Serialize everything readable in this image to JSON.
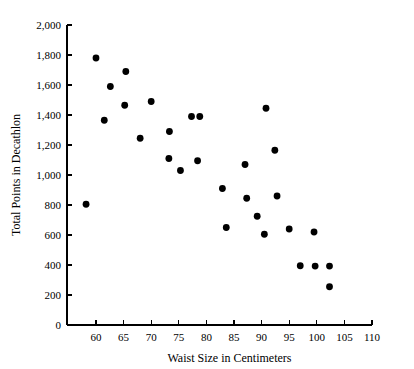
{
  "chart_data": {
    "type": "scatter",
    "title": "",
    "xlabel": "Waist Size in Centimeters",
    "ylabel": "Total Points in Decathlon",
    "xlim": [
      56,
      110
    ],
    "ylim": [
      0,
      2000
    ],
    "xticks": [
      60,
      65,
      70,
      75,
      80,
      85,
      90,
      95,
      100,
      105,
      110
    ],
    "xtick_labels": [
      "60",
      "65",
      "70",
      "75",
      "80",
      "85",
      "90",
      "95",
      "100",
      "105",
      "110"
    ],
    "yticks": [
      0,
      200,
      400,
      600,
      800,
      1000,
      1200,
      1400,
      1600,
      1800,
      2000
    ],
    "ytick_labels": [
      "0",
      "200",
      "400",
      "600",
      "800",
      "1,000",
      "1,200",
      "1,400",
      "1,600",
      "1,800",
      "2,000"
    ],
    "grid": false,
    "legend": null,
    "marker": "filled-circle",
    "marker_color": "#000000",
    "points": [
      {
        "x": 58.2,
        "y": 805
      },
      {
        "x": 60.0,
        "y": 1780
      },
      {
        "x": 61.5,
        "y": 1365
      },
      {
        "x": 62.6,
        "y": 1590
      },
      {
        "x": 65.4,
        "y": 1690
      },
      {
        "x": 65.2,
        "y": 1465
      },
      {
        "x": 68.0,
        "y": 1245
      },
      {
        "x": 70.0,
        "y": 1490
      },
      {
        "x": 73.3,
        "y": 1290
      },
      {
        "x": 73.2,
        "y": 1110
      },
      {
        "x": 75.3,
        "y": 1030
      },
      {
        "x": 77.3,
        "y": 1390
      },
      {
        "x": 78.8,
        "y": 1390
      },
      {
        "x": 78.4,
        "y": 1095
      },
      {
        "x": 82.9,
        "y": 910
      },
      {
        "x": 83.6,
        "y": 650
      },
      {
        "x": 87.0,
        "y": 1070
      },
      {
        "x": 87.3,
        "y": 845
      },
      {
        "x": 89.2,
        "y": 725
      },
      {
        "x": 90.8,
        "y": 1445
      },
      {
        "x": 90.5,
        "y": 605
      },
      {
        "x": 92.4,
        "y": 1165
      },
      {
        "x": 92.8,
        "y": 860
      },
      {
        "x": 95.0,
        "y": 640
      },
      {
        "x": 99.5,
        "y": 620
      },
      {
        "x": 97.0,
        "y": 395
      },
      {
        "x": 99.7,
        "y": 393
      },
      {
        "x": 102.3,
        "y": 393
      },
      {
        "x": 102.3,
        "y": 255
      }
    ]
  }
}
